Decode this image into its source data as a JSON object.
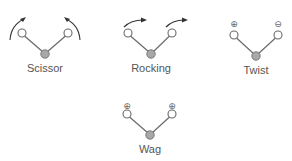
{
  "diagram": {
    "type": "bending-vibration-modes",
    "colors": {
      "bond": "#6a6a6a",
      "outer_atom_fill": "#ffffff",
      "center_atom_fill": "#a8a8a8",
      "arrow": "#333333",
      "label": "#555555"
    },
    "modes": [
      {
        "id": "scissor",
        "label": "Scissor",
        "motion": "in-plane, atoms move toward each other",
        "indicators": [
          "curved-arrow",
          "curved-arrow"
        ]
      },
      {
        "id": "rocking",
        "label": "Rocking",
        "motion": "in-plane, atoms move in same direction",
        "indicators": [
          "curved-arrow",
          "curved-arrow"
        ]
      },
      {
        "id": "twist",
        "label": "Twist",
        "motion": "out-of-plane, opposite directions",
        "indicators": [
          "⊕",
          "⊖"
        ]
      },
      {
        "id": "wag",
        "label": "Wag",
        "motion": "out-of-plane, same direction",
        "indicators": [
          "⊕",
          "⊕"
        ]
      }
    ]
  }
}
